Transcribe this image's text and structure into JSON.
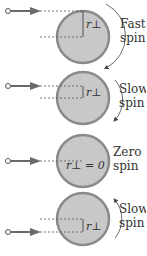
{
  "colors": {
    "disk_fill": "#c8c8c8",
    "disk_rim": "#8a8a8a",
    "arrow": "#6a6a6a",
    "text": "#333333",
    "dashed": "#555555"
  },
  "panels": [
    {
      "spin_label_1": "Fast",
      "spin_label_2": "spin",
      "radius_label": "r⊥",
      "rotation": "clockwise-long"
    },
    {
      "spin_label_1": "Slow",
      "spin_label_2": "spin",
      "radius_label": "r⊥",
      "rotation": "clockwise-short"
    },
    {
      "spin_label_1": "Zero",
      "spin_label_2": "spin",
      "radius_label": "r⊥ = 0",
      "rotation": "none"
    },
    {
      "spin_label_1": "Slow",
      "spin_label_2": "spin",
      "radius_label": "r⊥",
      "rotation": "counterclockwise-short"
    }
  ]
}
